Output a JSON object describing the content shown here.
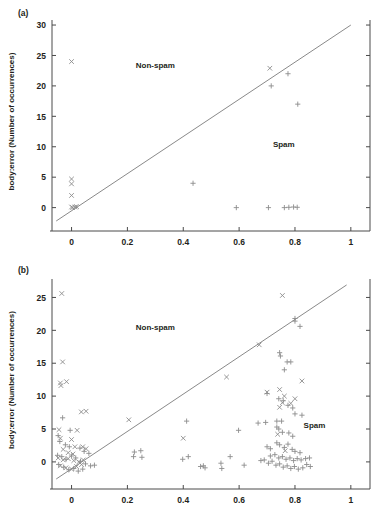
{
  "figure": {
    "title": "",
    "panels": [
      "a",
      "b"
    ]
  },
  "panel_a": {
    "tag": "(a)",
    "region_nonspam": "Non-spam",
    "region_spam": "Spam"
  },
  "panel_b": {
    "tag": "(b)",
    "region_nonspam": "Non-spam",
    "region_spam": "Spam"
  },
  "chart_data": [
    {
      "type": "scatter",
      "panel": "a",
      "title": "",
      "xlabel": "",
      "ylabel": "body:error (Number of occurrences)",
      "xlim": [
        -0.07,
        1.04
      ],
      "ylim": [
        -2.2,
        30.5
      ],
      "xticks": [
        0,
        0.2,
        0.4,
        0.6,
        0.8,
        1
      ],
      "xticklabels": [
        "0",
        "0.2",
        "0.4",
        "0.6",
        "0.8",
        "1"
      ],
      "yticks": [
        0,
        5,
        10,
        15,
        20,
        25,
        30
      ],
      "yticklabels": [
        "0",
        "5",
        "10",
        "15",
        "20",
        "25",
        "30"
      ],
      "grid": false,
      "legend": null,
      "annotations": [
        {
          "text": "Non-spam",
          "x": 0.3,
          "y": 23.0
        },
        {
          "text": "Spam",
          "x": 0.76,
          "y": 10.0
        }
      ],
      "decision_boundary": {
        "type": "line",
        "from": [
          -0.055,
          -2.2
        ],
        "to": [
          1.0,
          30.0
        ],
        "slope": 30.5,
        "note": "diagonal separator"
      },
      "series": [
        {
          "name": "Non-spam",
          "marker": "x",
          "color": "#8c8c8c",
          "points": [
            [
              0.0,
              24.0
            ],
            [
              0.71,
              22.9
            ],
            [
              0.0,
              4.7
            ],
            [
              0.0,
              3.9
            ],
            [
              0.0,
              2.0
            ],
            [
              0.0,
              0.1
            ],
            [
              0.004,
              0.0
            ],
            [
              0.012,
              0.1
            ],
            [
              0.018,
              0.15
            ]
          ]
        },
        {
          "name": "Spam",
          "marker": "+",
          "color": "#8c8c8c",
          "points": [
            [
              0.715,
              20.0
            ],
            [
              0.775,
              22.0
            ],
            [
              0.81,
              17.0
            ],
            [
              0.435,
              4.0
            ],
            [
              0.59,
              0.0
            ],
            [
              0.705,
              0.0
            ],
            [
              0.762,
              0.0
            ],
            [
              0.778,
              0.05
            ],
            [
              0.795,
              0.1
            ],
            [
              0.808,
              0.05
            ]
          ]
        }
      ]
    },
    {
      "type": "scatter",
      "panel": "b",
      "title": "",
      "xlabel": "",
      "ylabel": "body:error (Number of occurrences)",
      "xlim": [
        -0.07,
        1.04
      ],
      "ylim": [
        -2.6,
        27.5
      ],
      "xticks": [
        0,
        0.2,
        0.4,
        0.6,
        0.8,
        1
      ],
      "xticklabels": [
        "0",
        "0.2",
        "0.4",
        "0.6",
        "0.8",
        "1"
      ],
      "yticks": [
        0,
        5,
        10,
        15,
        20,
        25
      ],
      "yticklabels": [
        "0",
        "5",
        "10",
        "15",
        "20",
        "25"
      ],
      "grid": false,
      "legend": null,
      "annotations": [
        {
          "text": "Non-spam",
          "x": 0.3,
          "y": 20.0
        },
        {
          "text": "Spam",
          "x": 0.87,
          "y": 5.2
        }
      ],
      "decision_boundary": {
        "type": "line",
        "from": [
          -0.055,
          -2.6
        ],
        "to": [
          0.985,
          26.9
        ],
        "slope": 28.4,
        "note": "diagonal separator"
      },
      "series": [
        {
          "name": "Non-spam",
          "marker": "x",
          "color": "#8c8c8c",
          "points": [
            [
              -0.035,
              25.6
            ],
            [
              0.755,
              25.3
            ],
            [
              -0.032,
              15.2
            ],
            [
              0.672,
              17.8
            ],
            [
              -0.04,
              12.0
            ],
            [
              -0.038,
              11.6
            ],
            [
              -0.018,
              12.2
            ],
            [
              0.555,
              12.9
            ],
            [
              0.825,
              12.3
            ],
            [
              0.035,
              7.6
            ],
            [
              0.052,
              7.7
            ],
            [
              0.7,
              10.6
            ],
            [
              0.745,
              11.0
            ],
            [
              0.762,
              10.0
            ],
            [
              0.205,
              6.4
            ],
            [
              0.745,
              8.3
            ],
            [
              0.785,
              8.9
            ],
            [
              0.4,
              3.6
            ],
            [
              -0.045,
              4.9
            ],
            [
              0.02,
              4.8
            ],
            [
              -0.04,
              3.6
            ],
            [
              0.0,
              3.4
            ],
            [
              0.012,
              2.3
            ],
            [
              0.04,
              2.3
            ],
            [
              0.052,
              2.0
            ],
            [
              -0.03,
              1.9
            ],
            [
              -0.012,
              1.4
            ],
            [
              0.005,
              1.2
            ],
            [
              -0.048,
              0.6
            ],
            [
              -0.03,
              0.3
            ],
            [
              -0.012,
              0.5
            ],
            [
              0.008,
              0.2
            ],
            [
              0.026,
              0.0
            ],
            [
              0.042,
              0.3
            ],
            [
              -0.04,
              -0.6
            ],
            [
              -0.02,
              -0.9
            ],
            [
              0.0,
              -1.1
            ],
            [
              0.018,
              -0.7
            ],
            [
              0.036,
              -0.4
            ],
            [
              0.755,
              9.0
            ],
            [
              0.8,
              9.6
            ],
            [
              0.738,
              4.2
            ],
            [
              0.765,
              1.7
            ]
          ]
        },
        {
          "name": "Spam",
          "marker": "+",
          "color": "#8c8c8c",
          "points": [
            [
              0.8,
              21.8
            ],
            [
              0.8,
              21.4
            ],
            [
              0.818,
              20.6
            ],
            [
              0.745,
              16.6
            ],
            [
              0.748,
              16.1
            ],
            [
              0.772,
              15.2
            ],
            [
              0.785,
              15.2
            ],
            [
              0.762,
              14.0
            ],
            [
              0.7,
              10.4
            ],
            [
              0.742,
              9.6
            ],
            [
              0.758,
              9.3
            ],
            [
              0.775,
              8.6
            ],
            [
              0.792,
              8.2
            ],
            [
              0.8,
              7.3
            ],
            [
              0.825,
              7.1
            ],
            [
              0.695,
              6.0
            ],
            [
              0.735,
              6.2
            ],
            [
              0.752,
              6.2
            ],
            [
              0.598,
              4.8
            ],
            [
              0.735,
              5.3
            ],
            [
              0.742,
              5.0
            ],
            [
              0.755,
              4.5
            ],
            [
              0.778,
              4.4
            ],
            [
              0.792,
              3.9
            ],
            [
              0.7,
              2.3
            ],
            [
              0.712,
              2.0
            ],
            [
              0.735,
              2.9
            ],
            [
              0.745,
              2.6
            ],
            [
              0.762,
              2.2
            ],
            [
              0.775,
              2.7
            ],
            [
              0.79,
              1.9
            ],
            [
              0.8,
              1.6
            ],
            [
              0.818,
              1.4
            ],
            [
              0.712,
              0.9
            ],
            [
              0.728,
              1.1
            ],
            [
              0.742,
              0.6
            ],
            [
              0.755,
              0.8
            ],
            [
              0.768,
              0.4
            ],
            [
              0.782,
              0.6
            ],
            [
              0.795,
              0.2
            ],
            [
              0.808,
              0.5
            ],
            [
              0.822,
              0.3
            ],
            [
              0.838,
              0.5
            ],
            [
              0.852,
              0.6
            ],
            [
              0.705,
              -0.2
            ],
            [
              0.718,
              0.1
            ],
            [
              0.732,
              -0.5
            ],
            [
              0.745,
              -0.3
            ],
            [
              0.758,
              -0.8
            ],
            [
              0.772,
              -0.6
            ],
            [
              0.785,
              -1.0
            ],
            [
              0.798,
              -0.7
            ],
            [
              0.812,
              -1.1
            ],
            [
              0.828,
              -0.9
            ],
            [
              0.842,
              -0.4
            ],
            [
              0.855,
              -0.7
            ],
            [
              0.69,
              0.3
            ],
            [
              0.678,
              0.2
            ],
            [
              0.412,
              6.2
            ],
            [
              0.668,
              5.9
            ],
            [
              0.225,
              1.5
            ],
            [
              0.248,
              1.7
            ],
            [
              0.222,
              0.8
            ],
            [
              0.252,
              0.7
            ],
            [
              0.398,
              0.4
            ],
            [
              0.418,
              0.8
            ],
            [
              0.462,
              -0.7
            ],
            [
              0.472,
              -0.6
            ],
            [
              0.478,
              -0.9
            ],
            [
              0.535,
              -0.2
            ],
            [
              0.538,
              -1.0
            ],
            [
              0.568,
              0.8
            ],
            [
              0.618,
              -0.5
            ],
            [
              -0.032,
              6.7
            ],
            [
              -0.048,
              4.0
            ],
            [
              -0.005,
              4.8
            ],
            [
              -0.042,
              3.1
            ],
            [
              -0.022,
              2.6
            ],
            [
              -0.008,
              2.3
            ],
            [
              0.03,
              2.1
            ],
            [
              0.045,
              1.6
            ],
            [
              0.062,
              1.3
            ],
            [
              -0.05,
              1.0
            ],
            [
              -0.035,
              0.8
            ],
            [
              -0.02,
              0.4
            ],
            [
              0.0,
              0.9
            ],
            [
              0.015,
              0.6
            ],
            [
              0.032,
              0.1
            ],
            [
              0.05,
              -0.3
            ],
            [
              0.068,
              -0.6
            ],
            [
              -0.046,
              -0.4
            ],
            [
              -0.028,
              -0.8
            ],
            [
              -0.01,
              -1.2
            ],
            [
              0.008,
              -1.0
            ],
            [
              0.024,
              -1.4
            ],
            [
              0.04,
              -1.1
            ],
            [
              0.082,
              -0.5
            ]
          ]
        }
      ]
    }
  ]
}
